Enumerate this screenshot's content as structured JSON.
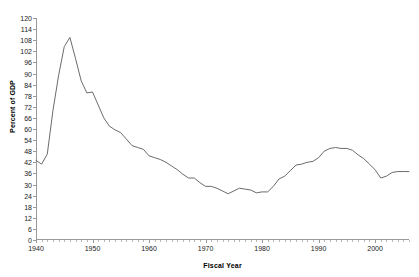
{
  "chart_data": {
    "type": "line",
    "title": "",
    "xlabel": "Fiscal Year",
    "ylabel": "Percent of GDP",
    "xlim": [
      1940,
      2006
    ],
    "ylim": [
      0,
      120
    ],
    "ytick_step": 6,
    "yticks": [
      0,
      6,
      12,
      18,
      24,
      30,
      36,
      42,
      48,
      54,
      60,
      66,
      72,
      78,
      84,
      90,
      96,
      102,
      108,
      114,
      120
    ],
    "xticks": [
      1940,
      1950,
      1960,
      1970,
      1980,
      1990,
      2000
    ],
    "xtick_minor_step": 1,
    "grid": false,
    "legend": "none",
    "line_color": "#5a5a5a",
    "axis_color": "#9a9a9a",
    "series": [
      {
        "name": "Gross Federal Debt",
        "x": [
          1940,
          1941,
          1942,
          1943,
          1944,
          1945,
          1946,
          1947,
          1948,
          1949,
          1950,
          1951,
          1952,
          1953,
          1954,
          1955,
          1956,
          1957,
          1958,
          1959,
          1960,
          1961,
          1962,
          1963,
          1964,
          1965,
          1966,
          1967,
          1968,
          1969,
          1970,
          1971,
          1972,
          1973,
          1974,
          1975,
          1976,
          1977,
          1978,
          1979,
          1980,
          1981,
          1982,
          1983,
          1984,
          1985,
          1986,
          1987,
          1988,
          1989,
          1990,
          1991,
          1992,
          1993,
          1994,
          1995,
          1996,
          1997,
          1998,
          1999,
          2000,
          2001,
          2002,
          2003,
          2004,
          2005,
          2006
        ],
        "values": [
          43.0,
          41.0,
          46.5,
          70.0,
          89.0,
          104.5,
          109.5,
          98.0,
          86.0,
          79.5,
          80.0,
          73.0,
          66.0,
          61.5,
          59.5,
          58.0,
          54.5,
          51.0,
          50.0,
          49.0,
          45.5,
          44.5,
          43.5,
          42.0,
          40.0,
          38.0,
          35.5,
          33.5,
          33.5,
          31.0,
          29.0,
          29.0,
          28.0,
          26.5,
          25.0,
          26.5,
          28.0,
          27.5,
          27.0,
          25.5,
          26.0,
          26.0,
          29.0,
          33.0,
          34.5,
          37.5,
          40.5,
          41.0,
          42.0,
          42.5,
          44.5,
          48.0,
          49.5,
          50.0,
          49.5,
          49.5,
          48.5,
          46.0,
          44.0,
          41.0,
          38.0,
          33.5,
          34.5,
          36.5,
          37.0,
          37.0,
          37.0
        ]
      }
    ]
  },
  "axis": {
    "ylabel_text": "Percent of GDP",
    "xlabel_text": "Fiscal Year"
  }
}
